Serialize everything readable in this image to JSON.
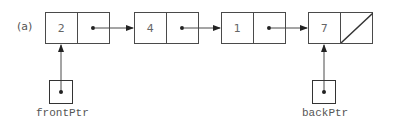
{
  "figure_label": "(a)",
  "nodes": [
    {
      "value": "2",
      "next": "pointer"
    },
    {
      "value": "4",
      "next": "pointer"
    },
    {
      "value": "1",
      "next": "pointer"
    },
    {
      "value": "7",
      "next": "null"
    }
  ],
  "pointers": {
    "front": {
      "label": "frontPtr",
      "points_to_index": 0
    },
    "back": {
      "label": "backPtr",
      "points_to_index": 3
    }
  },
  "colors": {
    "line": "#4a4a4a",
    "text": "#666666"
  }
}
